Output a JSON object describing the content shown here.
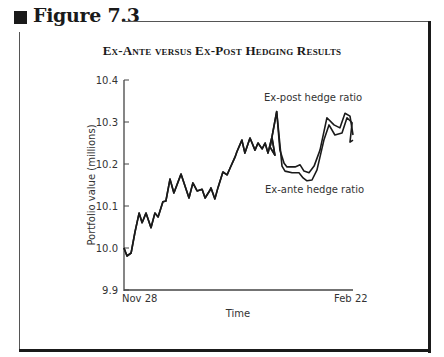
{
  "figure": {
    "label": "Figure 7.3",
    "title": "Ex-Ante versus Ex-Post Hedging Results"
  },
  "chart_data": {
    "type": "line",
    "title": "Ex-Ante versus Ex-Post Hedging Results",
    "xlabel": "Time",
    "ylabel": "Portfolio value (millions)",
    "x_tick_labels": [
      "Nov 28",
      "Feb 22"
    ],
    "y_ticks": [
      9.9,
      10.0,
      10.1,
      10.2,
      10.3,
      10.4
    ],
    "ylim": [
      9.9,
      10.4
    ],
    "grid": false,
    "legend": "inline annotations",
    "annotations": [
      {
        "text": "Ex-post hedge ratio",
        "near": "upper line, right portion"
      },
      {
        "text": "Ex-ante hedge ratio",
        "near": "lower line, right portion"
      }
    ],
    "x_index_range": [
      0,
      1
    ],
    "series": [
      {
        "name": "Ex-post hedge ratio",
        "style": "dashed (diverges after peak)",
        "points": [
          [
            0.0,
            10.0
          ],
          [
            0.013,
            9.981
          ],
          [
            0.031,
            9.988
          ],
          [
            0.048,
            10.038
          ],
          [
            0.066,
            10.083
          ],
          [
            0.079,
            10.06
          ],
          [
            0.096,
            10.083
          ],
          [
            0.118,
            10.048
          ],
          [
            0.135,
            10.083
          ],
          [
            0.149,
            10.074
          ],
          [
            0.17,
            10.11
          ],
          [
            0.183,
            10.112
          ],
          [
            0.201,
            10.164
          ],
          [
            0.218,
            10.131
          ],
          [
            0.249,
            10.176
          ],
          [
            0.284,
            10.119
          ],
          [
            0.301,
            10.155
          ],
          [
            0.319,
            10.136
          ],
          [
            0.341,
            10.14
          ],
          [
            0.354,
            10.119
          ],
          [
            0.376,
            10.138
          ],
          [
            0.38,
            10.143
          ],
          [
            0.397,
            10.117
          ],
          [
            0.41,
            10.143
          ],
          [
            0.432,
            10.181
          ],
          [
            0.45,
            10.174
          ],
          [
            0.463,
            10.19
          ],
          [
            0.485,
            10.217
          ],
          [
            0.493,
            10.229
          ],
          [
            0.515,
            10.257
          ],
          [
            0.528,
            10.226
          ],
          [
            0.55,
            10.262
          ],
          [
            0.572,
            10.233
          ],
          [
            0.585,
            10.25
          ],
          [
            0.603,
            10.236
          ],
          [
            0.616,
            10.25
          ],
          [
            0.629,
            10.226
          ],
          [
            0.646,
            10.264
          ],
          [
            0.659,
            10.221
          ],
          [
            0.638,
            10.24
          ],
          [
            0.638,
            10.24
          ],
          [
            0.667,
            10.325
          ],
          [
            0.681,
            10.233
          ],
          [
            0.699,
            10.202
          ],
          [
            0.712,
            10.193
          ],
          [
            0.747,
            10.193
          ],
          [
            0.769,
            10.198
          ],
          [
            0.786,
            10.183
          ],
          [
            0.808,
            10.179
          ],
          [
            0.83,
            10.195
          ],
          [
            0.856,
            10.233
          ],
          [
            0.886,
            10.31
          ],
          [
            0.917,
            10.293
          ],
          [
            0.943,
            10.286
          ],
          [
            0.965,
            10.321
          ],
          [
            0.987,
            10.314
          ],
          [
            1.0,
            10.269
          ]
        ]
      },
      {
        "name": "Ex-ante hedge ratio",
        "style": "solid",
        "points": [
          [
            0.0,
            10.0
          ],
          [
            0.013,
            9.981
          ],
          [
            0.031,
            9.988
          ],
          [
            0.048,
            10.038
          ],
          [
            0.066,
            10.083
          ],
          [
            0.079,
            10.06
          ],
          [
            0.096,
            10.083
          ],
          [
            0.118,
            10.048
          ],
          [
            0.135,
            10.083
          ],
          [
            0.149,
            10.074
          ],
          [
            0.17,
            10.11
          ],
          [
            0.183,
            10.112
          ],
          [
            0.201,
            10.164
          ],
          [
            0.218,
            10.131
          ],
          [
            0.249,
            10.176
          ],
          [
            0.284,
            10.119
          ],
          [
            0.301,
            10.155
          ],
          [
            0.319,
            10.136
          ],
          [
            0.341,
            10.14
          ],
          [
            0.354,
            10.119
          ],
          [
            0.376,
            10.138
          ],
          [
            0.38,
            10.143
          ],
          [
            0.397,
            10.117
          ],
          [
            0.41,
            10.143
          ],
          [
            0.432,
            10.181
          ],
          [
            0.45,
            10.174
          ],
          [
            0.463,
            10.19
          ],
          [
            0.485,
            10.217
          ],
          [
            0.493,
            10.229
          ],
          [
            0.515,
            10.257
          ],
          [
            0.528,
            10.226
          ],
          [
            0.55,
            10.262
          ],
          [
            0.572,
            10.233
          ],
          [
            0.585,
            10.25
          ],
          [
            0.603,
            10.236
          ],
          [
            0.616,
            10.25
          ],
          [
            0.629,
            10.226
          ],
          [
            0.646,
            10.264
          ],
          [
            0.659,
            10.221
          ],
          [
            0.638,
            10.24
          ],
          [
            0.638,
            10.24
          ],
          [
            0.667,
            10.325
          ],
          [
            0.69,
            10.195
          ],
          [
            0.703,
            10.183
          ],
          [
            0.734,
            10.179
          ],
          [
            0.764,
            10.179
          ],
          [
            0.782,
            10.167
          ],
          [
            0.799,
            10.16
          ],
          [
            0.821,
            10.162
          ],
          [
            0.843,
            10.186
          ],
          [
            0.873,
            10.257
          ],
          [
            0.895,
            10.293
          ],
          [
            0.921,
            10.269
          ],
          [
            0.952,
            10.274
          ],
          [
            0.974,
            10.31
          ],
          [
            0.996,
            10.298
          ],
          [
            0.987,
            10.252
          ],
          [
            1.0,
            10.257
          ]
        ]
      }
    ]
  },
  "plot": {
    "x0": 124,
    "x1": 353,
    "y_top_px": 80,
    "y_bottom_px": 290,
    "ymin": 9.9,
    "ymax": 10.4
  }
}
